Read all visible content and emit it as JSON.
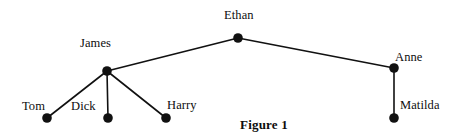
{
  "figure": {
    "caption": "Figure 1",
    "caption_x": 240,
    "caption_y": 117,
    "width": 458,
    "height": 136,
    "background_color": "#ffffff",
    "node_color": "#111111",
    "edge_color": "#111111",
    "text_color": "#0d0d0d",
    "node_radius": 4.8,
    "edge_width": 1.6
  },
  "nodes": [
    {
      "id": "ethan",
      "label": "Ethan",
      "x": 238,
      "y": 38,
      "label_x": 224,
      "label_y": 9,
      "label_anchor": "above"
    },
    {
      "id": "james",
      "label": "James",
      "x": 107,
      "y": 71,
      "label_x": 80,
      "label_y": 37,
      "label_anchor": "above-left"
    },
    {
      "id": "anne",
      "label": "Anne",
      "x": 394,
      "y": 68,
      "label_x": 395,
      "label_y": 51,
      "label_anchor": "above-right"
    },
    {
      "id": "tom",
      "label": "Tom",
      "x": 47,
      "y": 118,
      "label_x": 22,
      "label_y": 100,
      "label_anchor": "above-left"
    },
    {
      "id": "dick",
      "label": "Dick",
      "x": 108,
      "y": 118,
      "label_x": 71,
      "label_y": 100,
      "label_anchor": "above-left"
    },
    {
      "id": "harry",
      "label": "Harry",
      "x": 166,
      "y": 118,
      "label_x": 167,
      "label_y": 99,
      "label_anchor": "above-right"
    },
    {
      "id": "matilda",
      "label": "Matilda",
      "x": 394,
      "y": 118,
      "label_x": 400,
      "label_y": 99,
      "label_anchor": "right"
    }
  ],
  "edges": [
    {
      "id": "ethan-james",
      "from": "ethan",
      "to": "james"
    },
    {
      "id": "ethan-anne",
      "from": "ethan",
      "to": "anne"
    },
    {
      "id": "james-tom",
      "from": "james",
      "to": "tom"
    },
    {
      "id": "james-dick",
      "from": "james",
      "to": "dick"
    },
    {
      "id": "james-harry",
      "from": "james",
      "to": "harry"
    },
    {
      "id": "anne-matilda",
      "from": "anne",
      "to": "matilda"
    }
  ]
}
